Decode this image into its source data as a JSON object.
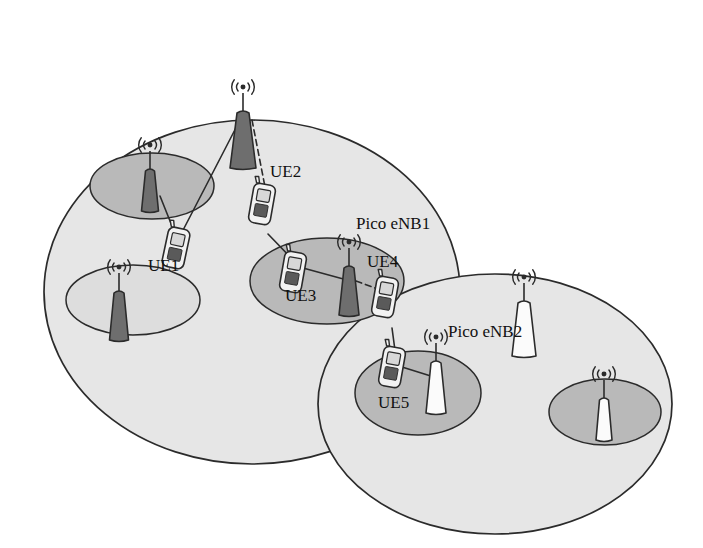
{
  "figure": {
    "kind": "network-topology-diagram",
    "background_color": "#ffffff",
    "palette": {
      "outline": "#2b2b2b",
      "macro_cell_fill": "#e6e6e6",
      "pico_cell_fill_dark": "#b9b9b9",
      "pico_cell_fill_light": "#dddddd",
      "tower_dark_fill": "#6e6e6e",
      "tower_light_fill": "#fbfbfb",
      "ue_body_fill": "#f2f2f2",
      "ue_screen_fill": "#d8d8d8",
      "ue_keypad_fill": "#5a5a5a",
      "link_solid_color": "#2b2b2b",
      "link_dashed_color": "#2b2b2b"
    }
  },
  "labels": {
    "ue1": "UE1",
    "ue2": "UE2",
    "ue3": "UE3",
    "ue4": "UE4",
    "ue5": "UE5",
    "pico_enb1": "Pico eNB1",
    "pico_enb2": "Pico eNB2"
  },
  "label_positions": [
    {
      "id": "ue2",
      "text": "UE2",
      "x": 270,
      "y": 163,
      "font_size": 17
    },
    {
      "id": "pico_enb1",
      "text": "Pico eNB1",
      "x": 356,
      "y": 215,
      "font_size": 17
    },
    {
      "id": "ue1",
      "text": "UE1",
      "x": 148,
      "y": 257,
      "font_size": 17
    },
    {
      "id": "ue4",
      "text": "UE4",
      "x": 367,
      "y": 253,
      "font_size": 17
    },
    {
      "id": "ue3",
      "text": "UE3",
      "x": 285,
      "y": 287,
      "font_size": 17
    },
    {
      "id": "pico_enb2",
      "text": "Pico eNB2",
      "x": 448,
      "y": 323,
      "font_size": 17
    },
    {
      "id": "ue5",
      "text": "UE5",
      "x": 378,
      "y": 394,
      "font_size": 17
    }
  ],
  "macro_cells": [
    {
      "id": "macro-cell-1",
      "cx": 252,
      "cy": 292,
      "rx": 208,
      "ry": 172,
      "fill": "#e6e6e6"
    },
    {
      "id": "macro-cell-2",
      "cx": 495,
      "cy": 404,
      "rx": 177,
      "ry": 130,
      "fill": "#e6e6e6"
    }
  ],
  "pico_cells": [
    {
      "id": "pico-cell-a",
      "cx": 152,
      "cy": 186,
      "rx": 62,
      "ry": 33,
      "fill": "#b9b9b9",
      "parent": "macro-cell-1"
    },
    {
      "id": "pico-cell-b",
      "cx": 133,
      "cy": 300,
      "rx": 67,
      "ry": 35,
      "fill": "#dddddd",
      "parent": "macro-cell-1"
    },
    {
      "id": "pico-cell-c",
      "cx": 327,
      "cy": 281,
      "rx": 77,
      "ry": 43,
      "fill": "#b9b9b9",
      "parent": "macro-cell-1"
    },
    {
      "id": "pico-cell-d",
      "cx": 418,
      "cy": 393,
      "rx": 63,
      "ry": 42,
      "fill": "#b9b9b9",
      "parent": "macro-cell-2"
    },
    {
      "id": "pico-cell-e",
      "cx": 605,
      "cy": 412,
      "rx": 56,
      "ry": 33,
      "fill": "#b9b9b9",
      "parent": "macro-cell-2"
    }
  ],
  "towers": [
    {
      "id": "macro-enb-1",
      "role": "macro",
      "x": 243,
      "y": 113,
      "height": 55,
      "top_w": 12,
      "bottom_w": 26,
      "fill": "#6e6e6e",
      "label": null
    },
    {
      "id": "pico-enb-a",
      "role": "pico",
      "x": 150,
      "y": 171,
      "height": 40,
      "top_w": 9,
      "bottom_w": 17,
      "fill": "#6e6e6e",
      "label": null
    },
    {
      "id": "pico-enb-b",
      "role": "pico",
      "x": 119,
      "y": 293,
      "height": 47,
      "top_w": 10,
      "bottom_w": 19,
      "fill": "#6e6e6e",
      "label": null
    },
    {
      "id": "pico-enb-1",
      "role": "pico",
      "x": 349,
      "y": 268,
      "height": 47,
      "top_w": 10,
      "bottom_w": 20,
      "fill": "#6e6e6e",
      "label": "Pico eNB1"
    },
    {
      "id": "macro-enb-2",
      "role": "macro",
      "x": 524,
      "y": 303,
      "height": 53,
      "top_w": 12,
      "bottom_w": 24,
      "fill": "#fbfbfb",
      "label": null
    },
    {
      "id": "pico-enb-2",
      "role": "pico",
      "x": 436,
      "y": 363,
      "height": 50,
      "top_w": 10,
      "bottom_w": 20,
      "fill": "#fbfbfb",
      "label": "Pico eNB2"
    },
    {
      "id": "pico-enb-e",
      "role": "pico",
      "x": 604,
      "y": 400,
      "height": 40,
      "top_w": 9,
      "bottom_w": 16,
      "fill": "#fbfbfb",
      "label": null
    }
  ],
  "ues": [
    {
      "id": "ue-top-left",
      "label": null,
      "x": 176,
      "y": 248,
      "rot": 12
    },
    {
      "id": "ue-2",
      "label": "UE2",
      "x": 262,
      "y": 204,
      "rot": 10
    },
    {
      "id": "ue-3",
      "label": "UE3",
      "x": 293,
      "y": 272,
      "rot": 10
    },
    {
      "id": "ue-4",
      "label": "UE4",
      "x": 385,
      "y": 297,
      "rot": 10
    },
    {
      "id": "ue-5",
      "label": "UE5",
      "x": 392,
      "y": 367,
      "rot": 10
    }
  ],
  "links": [
    {
      "id": "link-macro1-ue1",
      "from": "macro-enb-1",
      "to": "ue-top-left",
      "style": "solid",
      "x1": 240,
      "y1": 120,
      "x2": 180,
      "y2": 236
    },
    {
      "id": "link-macro1-ue2",
      "from": "macro-enb-1",
      "to": "ue-2",
      "style": "dashed",
      "x1": 252,
      "y1": 120,
      "x2": 266,
      "y2": 192
    },
    {
      "id": "link-picoA-ue1",
      "from": "pico-enb-a",
      "to": "ue-top-left",
      "style": "solid",
      "x1": 160,
      "y1": 196,
      "x2": 176,
      "y2": 236
    },
    {
      "id": "link-ue2-ue3",
      "from": "ue-2",
      "to": "ue-3",
      "style": "solid",
      "x1": 268,
      "y1": 234,
      "x2": 295,
      "y2": 262
    },
    {
      "id": "link-ue3-pico1",
      "from": "ue-3",
      "to": "pico-enb-1",
      "style": "solid",
      "x1": 303,
      "y1": 268,
      "x2": 347,
      "y2": 280
    },
    {
      "id": "link-pico1-ue4",
      "from": "pico-enb-1",
      "to": "ue-4",
      "style": "dashed",
      "x1": 356,
      "y1": 281,
      "x2": 386,
      "y2": 292
    },
    {
      "id": "link-ue4-ue5",
      "from": "ue-4",
      "to": "ue-5",
      "style": "solid",
      "x1": 392,
      "y1": 328,
      "x2": 396,
      "y2": 358
    },
    {
      "id": "link-ue5-pico2",
      "from": "ue-5",
      "to": "pico-enb-2",
      "style": "solid",
      "x1": 402,
      "y1": 367,
      "x2": 434,
      "y2": 377
    }
  ]
}
